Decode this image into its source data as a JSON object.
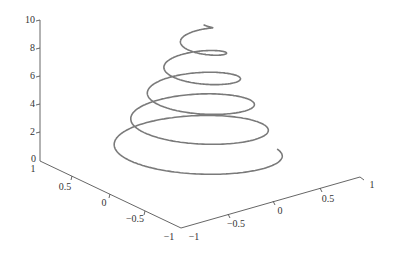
{
  "chart_data": {
    "type": "line3d",
    "title": "",
    "xlabel": "",
    "ylabel": "",
    "zlabel": "",
    "series": [
      {
        "name": "helix",
        "color": "#7a7a7a",
        "param": {
          "t_min": 0,
          "t_max": 9.6,
          "turns": 5.25,
          "radius_start": 1.0,
          "radius_end": 0.1
        }
      }
    ],
    "xlim": [
      -1,
      1
    ],
    "ylim": [
      -1,
      1
    ],
    "zlim": [
      0,
      10
    ],
    "grid": false,
    "legend": false,
    "z_axis": {
      "ticks": [
        {
          "value": 0,
          "label": "0"
        },
        {
          "value": 2,
          "label": "2"
        },
        {
          "value": 4,
          "label": "4"
        },
        {
          "value": 6,
          "label": "6"
        },
        {
          "value": 8,
          "label": "8"
        },
        {
          "value": 10,
          "label": "10"
        }
      ]
    },
    "left_axis": {
      "ticks": [
        {
          "value": 1,
          "label": "1"
        },
        {
          "value": 0.5,
          "label": "0.5"
        },
        {
          "value": 0,
          "label": "0"
        },
        {
          "value": -0.5,
          "label": "−0.5"
        },
        {
          "value": -1,
          "label": "−1"
        }
      ]
    },
    "right_axis": {
      "ticks": [
        {
          "value": -1,
          "label": "−1"
        },
        {
          "value": -0.5,
          "label": "−0.5"
        },
        {
          "value": 0,
          "label": "0"
        },
        {
          "value": 0.5,
          "label": "0.5"
        },
        {
          "value": 1,
          "label": "1"
        }
      ]
    }
  }
}
